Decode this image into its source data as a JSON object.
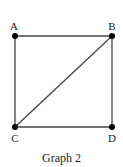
{
  "caption": "Graph 2",
  "colors": {
    "edge": "#444444",
    "node": "#000000",
    "text": "#222222"
  },
  "nodes": [
    {
      "id": "A",
      "label": "A",
      "x": 15,
      "y": 36,
      "lx": 14,
      "ly": 30
    },
    {
      "id": "B",
      "label": "B",
      "x": 112,
      "y": 36,
      "lx": 112,
      "ly": 30
    },
    {
      "id": "C",
      "label": "C",
      "x": 15,
      "y": 127,
      "lx": 15,
      "ly": 142
    },
    {
      "id": "D",
      "label": "D",
      "x": 112,
      "y": 127,
      "lx": 112,
      "ly": 142
    }
  ],
  "edges": [
    {
      "from": "A",
      "to": "B"
    },
    {
      "from": "A",
      "to": "C"
    },
    {
      "from": "B",
      "to": "D"
    },
    {
      "from": "C",
      "to": "D"
    },
    {
      "from": "B",
      "to": "C"
    }
  ]
}
